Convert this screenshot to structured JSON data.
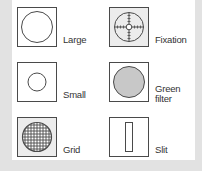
{
  "items": [
    {
      "id": "large",
      "label": "Large",
      "shape": "large-circle"
    },
    {
      "id": "fixation",
      "label": "Fixation",
      "shape": "crosshair-reticle"
    },
    {
      "id": "small",
      "label": "Small",
      "shape": "small-circle"
    },
    {
      "id": "green-filter",
      "label_line1": "Green",
      "label_line2": "filter",
      "shape": "filled-circle",
      "fill_color": "#c8c8c8"
    },
    {
      "id": "grid",
      "label": "Grid",
      "shape": "grid-circle"
    },
    {
      "id": "slit",
      "label": "Slit",
      "shape": "vertical-slit"
    }
  ],
  "colors": {
    "background": "#e2e2e2",
    "panel": "#ffffff",
    "stroke": "#4a4a4a",
    "shaded_box": "#ececec",
    "filter_fill": "#c8c8c8"
  }
}
